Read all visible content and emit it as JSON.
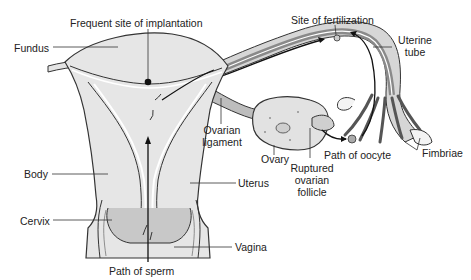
{
  "diagram": {
    "type": "anatomical-illustration",
    "colors": {
      "tissue_fill": "#e4e4e4",
      "tissue_dark": "#9a9a9a",
      "outline": "#333333",
      "label_text": "#222222",
      "background": "#ffffff"
    },
    "labels": {
      "implantation": "Frequent site of implantation",
      "fertilization": "Site of fertilization",
      "uterine_tube_1": "Uterine",
      "uterine_tube_2": "tube",
      "fundus": "Fundus",
      "ovarian_ligament_1": "Ovarian",
      "ovarian_ligament_2": "ligament",
      "ovary": "Ovary",
      "path_of_oocyte": "Path of oocyte",
      "fimbriae": "Fimbriae",
      "ruptured_1": "Ruptured",
      "ruptured_2": "ovarian",
      "ruptured_3": "follicle",
      "body": "Body",
      "uterus": "Uterus",
      "cervix": "Cervix",
      "vagina": "Vagina",
      "path_of_sperm": "Path of sperm"
    }
  }
}
